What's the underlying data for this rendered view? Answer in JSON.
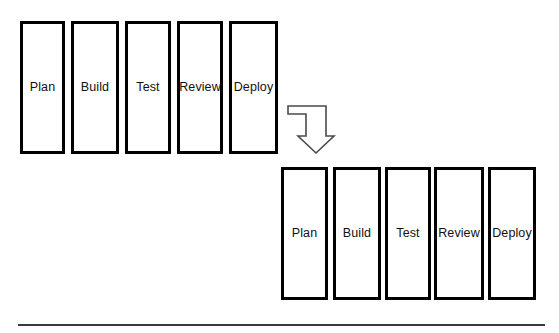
{
  "diagram": {
    "rows": [
      {
        "id": "top-row",
        "name": "original-pipeline-row",
        "stages": [
          {
            "label": "Plan",
            "x": 20,
            "y": 21,
            "w": 45,
            "h": 133
          },
          {
            "label": "Build",
            "x": 71,
            "y": 21,
            "w": 48,
            "h": 133
          },
          {
            "label": "Test",
            "x": 125,
            "y": 21,
            "w": 46,
            "h": 133
          },
          {
            "label": "Review",
            "x": 177,
            "y": 21,
            "w": 46,
            "h": 133
          },
          {
            "label": "Deploy",
            "x": 229,
            "y": 21,
            "w": 49,
            "h": 133
          }
        ]
      },
      {
        "id": "bottom-row",
        "name": "shifted-pipeline-row",
        "stages": [
          {
            "label": "Plan",
            "x": 281,
            "y": 167,
            "w": 47,
            "h": 133
          },
          {
            "label": "Build",
            "x": 333,
            "y": 167,
            "w": 48,
            "h": 133
          },
          {
            "label": "Test",
            "x": 385,
            "y": 167,
            "w": 46,
            "h": 133
          },
          {
            "label": "Review",
            "x": 434,
            "y": 167,
            "w": 50,
            "h": 133
          },
          {
            "label": "Deploy",
            "x": 488,
            "y": 167,
            "w": 48,
            "h": 133
          }
        ]
      }
    ],
    "arrow": {
      "name": "elbow-down-right-arrow",
      "icon": "arrow-elbow-down-icon",
      "stroke_color": "#444444"
    },
    "divider": {
      "name": "horizontal-divider",
      "color": "#3a3a3a"
    }
  }
}
